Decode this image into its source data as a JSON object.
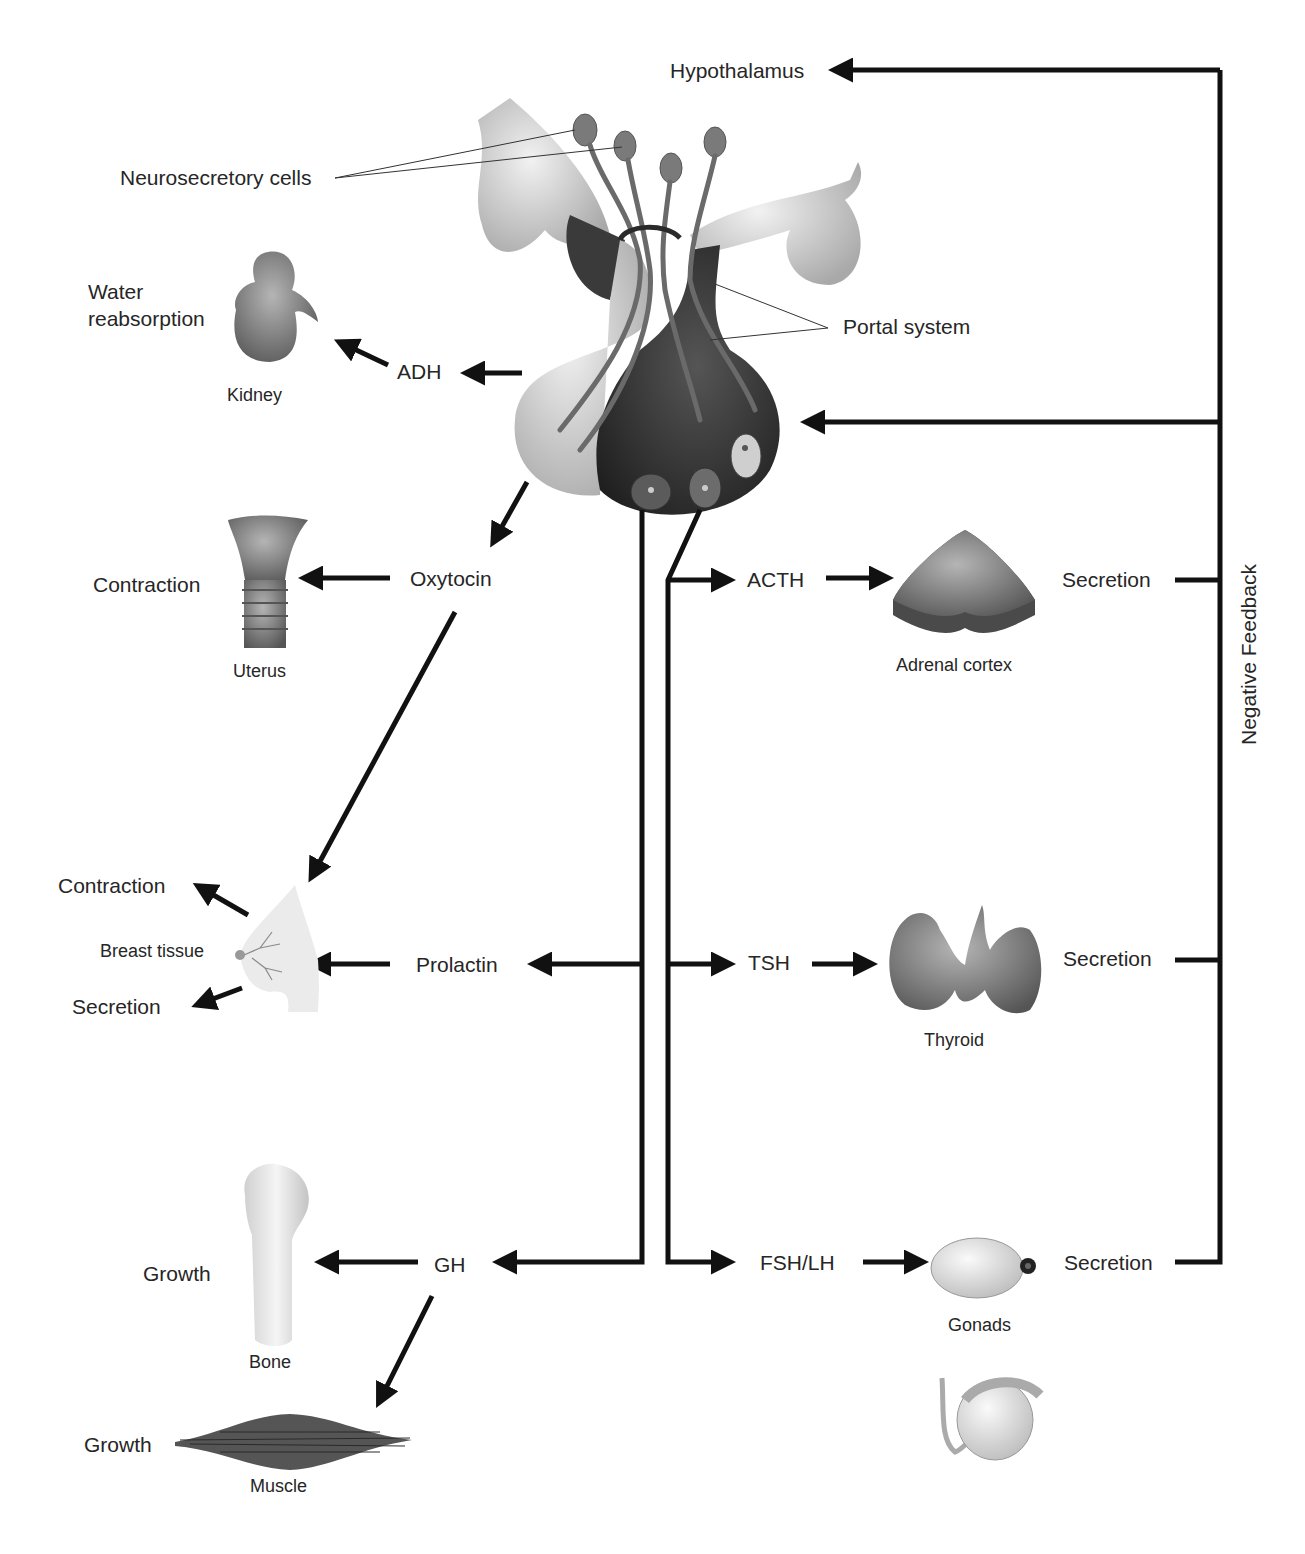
{
  "labels": {
    "hypothalamus": "Hypothalamus",
    "neurosecretory_cells": "Neurosecretory cells",
    "portal_system": "Portal system",
    "negative_feedback": "Negative Feedback"
  },
  "hormones": {
    "adh": "ADH",
    "oxytocin": "Oxytocin",
    "prolactin": "Prolactin",
    "gh": "GH",
    "acth": "ACTH",
    "tsh": "TSH",
    "fsh_lh": "FSH/LH"
  },
  "organs": {
    "kidney": "Kidney",
    "uterus": "Uterus",
    "breast": "Breast tissue",
    "bone": "Bone",
    "muscle": "Muscle",
    "adrenal": "Adrenal cortex",
    "thyroid": "Thyroid",
    "gonads": "Gonads"
  },
  "effects": {
    "kidney": "Water\nreabsorption",
    "kidney_line1": "Water",
    "kidney_line2": "reabsorption",
    "uterus": "Contraction",
    "breast_contraction": "Contraction",
    "breast_secretion": "Secretion",
    "bone": "Growth",
    "muscle": "Growth",
    "adrenal": "Secretion",
    "thyroid": "Secretion",
    "gonads": "Secretion"
  },
  "colors": {
    "line": "#111111",
    "posterior_lobe": "#d9d9d9",
    "anterior_lobe": "#3a3a3a",
    "organ_gray": "#7a7a7a"
  }
}
